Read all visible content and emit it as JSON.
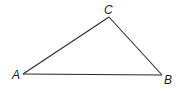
{
  "diagram": {
    "type": "triangle",
    "vertices": [
      {
        "id": "A",
        "label": "A",
        "x": 23,
        "y": 74,
        "label_x": 12,
        "label_y": 79
      },
      {
        "id": "B",
        "label": "B",
        "x": 162,
        "y": 75,
        "label_x": 164,
        "label_y": 84
      },
      {
        "id": "C",
        "label": "C",
        "x": 109,
        "y": 17,
        "label_x": 104,
        "label_y": 14
      }
    ],
    "edges": [
      {
        "from": "A",
        "to": "C"
      },
      {
        "from": "C",
        "to": "B"
      },
      {
        "from": "A",
        "to": "B"
      }
    ],
    "colors": {
      "stroke": "#2a2a2a",
      "label": "#1e1e1e",
      "background": "#ffffff"
    }
  }
}
